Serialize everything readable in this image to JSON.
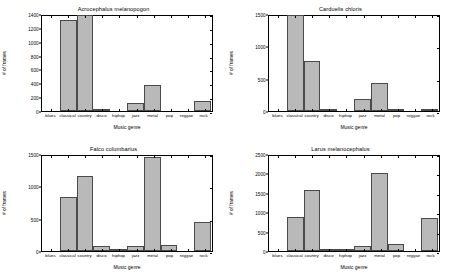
{
  "figure": {
    "width": 454,
    "height": 280,
    "background": "#ffffff",
    "bar_fill": "#b9b9b9",
    "bar_edge": "#4a4a4a",
    "axis_color": "#000000"
  },
  "chart_data": [
    {
      "type": "bar",
      "title": "Acrocephalus melanopogon",
      "xlabel": "Music genre",
      "ylabel": "# of frames",
      "categories": [
        "blues",
        "classical",
        "country",
        "disco",
        "hiphop",
        "jazz",
        "metal",
        "pop",
        "reggae",
        "rock"
      ],
      "values": [
        0,
        1310,
        1385,
        30,
        0,
        110,
        370,
        5,
        0,
        145
      ],
      "ylim": [
        0,
        1400
      ],
      "yticks": [
        0,
        200,
        400,
        600,
        800,
        1000,
        1200,
        1400
      ],
      "ytick_labels": [
        "0",
        "200",
        "400",
        "600",
        "800",
        "1000",
        "1200",
        "1400"
      ],
      "grid": false,
      "legend": "none"
    },
    {
      "type": "bar",
      "title": "Carduelis chloris",
      "xlabel": "Music genre",
      "ylabel": "# of frames",
      "categories": [
        "blues",
        "classical",
        "country",
        "disco",
        "hiphop",
        "jazz",
        "metal",
        "pop",
        "reggae",
        "rock"
      ],
      "values": [
        0,
        1490,
        770,
        25,
        0,
        190,
        430,
        10,
        0,
        20
      ],
      "ylim": [
        0,
        1500
      ],
      "yticks": [
        0,
        500,
        1000,
        1500
      ],
      "ytick_labels": [
        "0",
        "500",
        "1000",
        "1500"
      ],
      "grid": false,
      "legend": "none"
    },
    {
      "type": "bar",
      "title": "Falco columbarius",
      "xlabel": "Music genre",
      "ylabel": "# of frames",
      "categories": [
        "blues",
        "classical",
        "country",
        "disco",
        "hiphop",
        "jazz",
        "metal",
        "pop",
        "reggae",
        "rock"
      ],
      "values": [
        0,
        840,
        1165,
        70,
        10,
        85,
        1450,
        95,
        0,
        450
      ],
      "ylim": [
        0,
        1500
      ],
      "yticks": [
        0,
        500,
        1000,
        1500
      ],
      "ytick_labels": [
        "0",
        "500",
        "1000",
        "1500"
      ],
      "grid": false,
      "legend": "none"
    },
    {
      "type": "bar",
      "title": "Larus melanocephalus",
      "xlabel": "Music genre",
      "ylabel": "# of frames",
      "categories": [
        "blues",
        "classical",
        "country",
        "disco",
        "hiphop",
        "jazz",
        "metal",
        "pop",
        "reggae",
        "rock"
      ],
      "values": [
        0,
        880,
        1560,
        60,
        40,
        135,
        2000,
        170,
        0,
        860
      ],
      "ylim": [
        0,
        2500
      ],
      "yticks": [
        0,
        500,
        1000,
        1500,
        2000,
        2500
      ],
      "ytick_labels": [
        "0",
        "500",
        "1000",
        "1500",
        "2000",
        "2500"
      ],
      "grid": false,
      "legend": "none"
    }
  ]
}
